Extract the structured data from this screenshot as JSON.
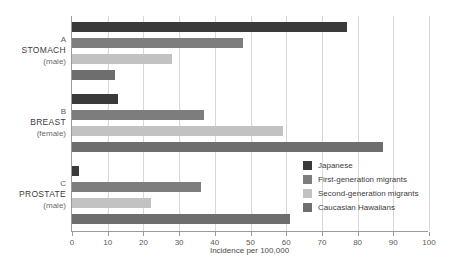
{
  "chart_data": {
    "type": "bar",
    "orientation": "horizontal",
    "title": "",
    "xlabel": "Incidence per 100,000",
    "ylabel": "",
    "xlim": [
      0,
      100
    ],
    "xticks": [
      0,
      10,
      20,
      30,
      40,
      50,
      60,
      70,
      80,
      90,
      100
    ],
    "grid": true,
    "legend_position": "inside-right",
    "categories": [
      {
        "letter": "A",
        "name": "STOMACH",
        "sex": "(male)"
      },
      {
        "letter": "B",
        "name": "BREAST",
        "sex": "(female)"
      },
      {
        "letter": "C",
        "name": "PROSTATE",
        "sex": "(male)"
      }
    ],
    "series": [
      {
        "name": "Japanese",
        "color": "#3a3a3a",
        "values": [
          77,
          13,
          2
        ]
      },
      {
        "name": "First-generation migrants",
        "color": "#7d7d7d",
        "values": [
          48,
          37,
          36
        ]
      },
      {
        "name": "Second-generation migrants",
        "color": "#c2c2c2",
        "values": [
          28,
          59,
          22
        ]
      },
      {
        "name": "Caucasian Hawaiians",
        "color": "#6e6e6e",
        "values": [
          12,
          87,
          61
        ]
      }
    ]
  }
}
